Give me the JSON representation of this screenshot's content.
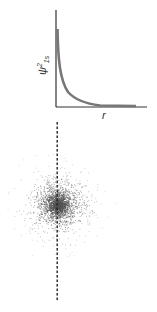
{
  "diagram": {
    "top_plot": {
      "ylabel_symbol": "ψ",
      "ylabel_sup": "2",
      "ylabel_sub": "1s",
      "xlabel": "r",
      "curve_color": "#777777",
      "axis_color": "#333333"
    },
    "bottom": {
      "description": "1s electron probability density dot cloud with dashed vertical axis",
      "dot_color": "#555555",
      "dashed_line_color": "#222222"
    }
  },
  "chart_data": {
    "type": "line",
    "title": "",
    "xlabel": "r",
    "ylabel": "ψ²₁s",
    "series": [
      {
        "name": "ψ²₁s",
        "x": [
          0,
          0.1,
          0.2,
          0.3,
          0.5,
          0.75,
          1.0,
          1.5,
          2.0,
          3.0,
          4.0
        ],
        "values": [
          1.0,
          0.67,
          0.45,
          0.3,
          0.14,
          0.05,
          0.02,
          0.005,
          0.001,
          0.0,
          0.0
        ]
      }
    ],
    "grid": false
  }
}
